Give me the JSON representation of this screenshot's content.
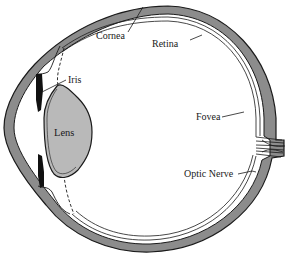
{
  "diagram": {
    "type": "anatomical-cross-section",
    "colors": {
      "sclera_fill": "#8c8c8c",
      "lens_fill": "#b9b9b9",
      "iris_fill": "#111111",
      "outline": "#1a1a1a",
      "background": "#ffffff"
    },
    "labels": {
      "cornea": "Cornea",
      "retina": "Retina",
      "iris": "Iris",
      "lens": "Lens",
      "fovea": "Fovea",
      "optic_nerve": "Optic Nerve"
    }
  }
}
